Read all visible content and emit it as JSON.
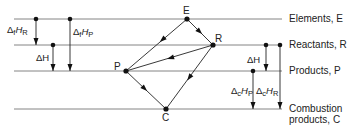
{
  "levels": [
    {
      "id": "elements",
      "label": "Elements, E",
      "y": 19
    },
    {
      "id": "reactants",
      "label": "Reactants, R",
      "y": 45
    },
    {
      "id": "products",
      "label": "Products, P",
      "y": 71
    },
    {
      "id": "combustion",
      "label_line1": "Combustion",
      "label_line2": "products, C",
      "y": 109
    }
  ],
  "points": {
    "E": "E",
    "R": "R",
    "P": "P",
    "C": "C"
  },
  "left_arrows": {
    "df_hr": {
      "delta": "Δ",
      "sub": "f",
      "H": "H",
      "sub2": "R"
    },
    "df_hp": {
      "delta": "Δ",
      "sub": "f",
      "H": "H",
      "sub2": "P"
    },
    "dh": "ΔH"
  },
  "right_arrows": {
    "dh": "ΔH",
    "dc_hp": {
      "delta": "Δ",
      "sub": "c",
      "H": "H",
      "sub2": "P"
    },
    "dc_hr": {
      "delta": "Δ",
      "sub": "c",
      "H": "H",
      "sub2": "R"
    }
  },
  "colors": {
    "line": "#555555",
    "ink": "#111111"
  }
}
